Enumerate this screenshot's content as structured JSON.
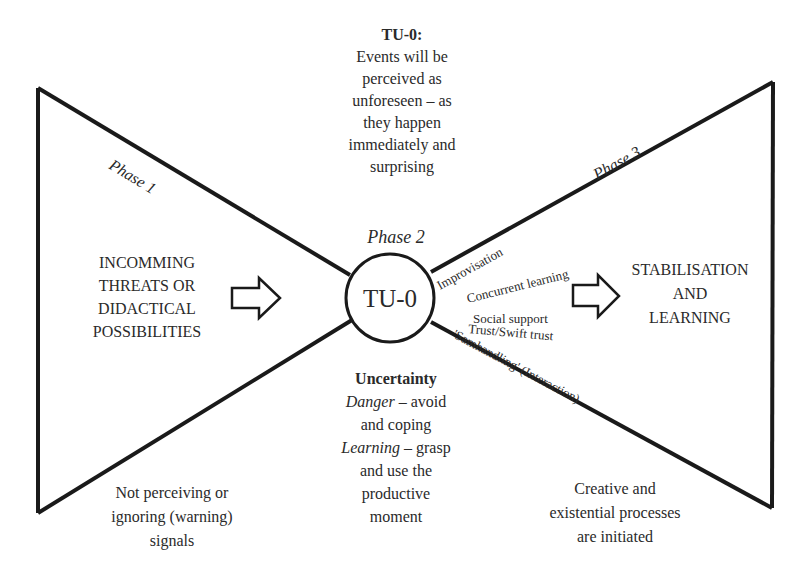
{
  "top_block": {
    "title": "TU-0:",
    "lines": [
      "Events will be",
      "perceived as",
      "unforeseen – as",
      "they happen",
      "immediately and",
      "surprising"
    ]
  },
  "phases": {
    "phase1": "Phase 1",
    "phase2": "Phase 2",
    "phase3": "Phase 3"
  },
  "center_circle": {
    "label": "TU-0"
  },
  "left_block": {
    "lines": [
      "INCOMMING",
      "THREATS OR",
      "DIDACTICAL",
      "POSSIBILITIES"
    ]
  },
  "right_block": {
    "lines": [
      "STABILISATION",
      "AND",
      "LEARNING"
    ]
  },
  "right_factors": {
    "improvisation": "Improvisation",
    "concurrent_learning": "Concurrent learning",
    "social_support": "Social support",
    "trust": "Trust/Swift trust",
    "samhandling": "'Samhandling' (Interaction)"
  },
  "uncertainty_block": {
    "title": "Uncertainty",
    "danger_label": "Danger",
    "danger_rest": " – avoid",
    "line2": "and coping",
    "learning_label": "Learning",
    "learning_rest": " – grasp",
    "line4": "and use the",
    "line5": "productive",
    "line6": "moment"
  },
  "bottom_left": {
    "lines": [
      "Not perceiving or",
      "ignoring (warning)",
      "signals"
    ]
  },
  "bottom_right": {
    "lines": [
      "Creative and",
      "existential processes",
      "are initiated"
    ]
  },
  "colors": {
    "stroke": "#1a1a1a",
    "text": "#2a2a2a",
    "background": "#ffffff"
  }
}
